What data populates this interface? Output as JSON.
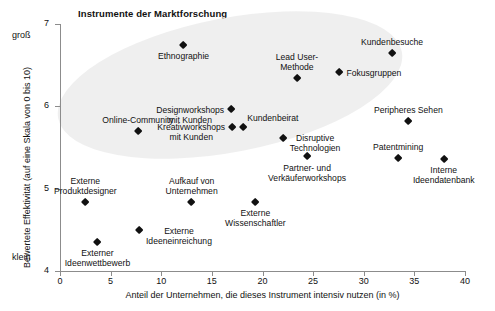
{
  "chart_data": {
    "type": "scatter",
    "title": "Instrumente der Marktforschung",
    "xlabel": "Anteil der Unternehmen, die dieses Instrument intensiv nutzen (in %)",
    "ylabel": "Bewertete Effektivität (auf eine Skala von 0 bis 10)",
    "ylabel_high": "groß",
    "ylabel_low": "klein",
    "xlim": [
      0,
      40
    ],
    "ylim": [
      4,
      7
    ],
    "xticks": [
      0,
      5,
      10,
      15,
      20,
      25,
      30,
      35,
      40
    ],
    "yticks": [
      4,
      5,
      6,
      7
    ],
    "grid": false,
    "legend": "none",
    "marker_color": "#111111",
    "cluster_shading_color": "#eeeeee",
    "annotation": "Eine hellgraue elliptische Fläche hebt die Instrumente mit hoher Effektivität hervor.",
    "points": [
      {
        "label": "Ethnographie",
        "x": 12.2,
        "y": 6.74,
        "label_pos": "below"
      },
      {
        "label": "Kundenbesuche",
        "x": 32.8,
        "y": 6.65,
        "label_pos": "above"
      },
      {
        "label": "Fokusgruppen",
        "x": 27.6,
        "y": 6.41,
        "label_pos": "right"
      },
      {
        "label": "Lead User-\nMethode",
        "x": 23.4,
        "y": 6.34,
        "label_pos": "above"
      },
      {
        "label": "Designworkshops\nmit Kunden",
        "x": 16.9,
        "y": 5.96,
        "label_pos": "left"
      },
      {
        "label": "Kreativworkshops\nmit Kunden",
        "x": 17.0,
        "y": 5.75,
        "label_pos": "left"
      },
      {
        "label": "Kundenbeirat",
        "x": 18.1,
        "y": 5.75,
        "label_pos": "above-right"
      },
      {
        "label": "Online-Community",
        "x": 7.7,
        "y": 5.7,
        "label_pos": "above"
      },
      {
        "label": "Peripheres Sehen",
        "x": 34.4,
        "y": 5.82,
        "label_pos": "above"
      },
      {
        "label": "Disruptive\nTechnologien",
        "x": 22.0,
        "y": 5.61,
        "label_pos": "right"
      },
      {
        "label": "Partner- und\nVerkäuferworkshops",
        "x": 24.4,
        "y": 5.39,
        "label_pos": "below"
      },
      {
        "label": "Patentmining",
        "x": 33.4,
        "y": 5.37,
        "label_pos": "above"
      },
      {
        "label": "Interne\nIdeendatenbank",
        "x": 37.9,
        "y": 5.36,
        "label_pos": "below"
      },
      {
        "label": "Externe\nProduktdesigner",
        "x": 2.5,
        "y": 4.84,
        "label_pos": "above"
      },
      {
        "label": "Aufkauf von\nUnternehmen",
        "x": 13.0,
        "y": 4.84,
        "label_pos": "above"
      },
      {
        "label": "Externe\nWissenschaftler",
        "x": 19.3,
        "y": 4.84,
        "label_pos": "below"
      },
      {
        "label": "Externe\nIdeeneinreichung",
        "x": 7.8,
        "y": 4.49,
        "label_pos": "right"
      },
      {
        "label": "Externer\nIdeenwettbewerb",
        "x": 3.7,
        "y": 4.35,
        "label_pos": "below"
      }
    ]
  }
}
